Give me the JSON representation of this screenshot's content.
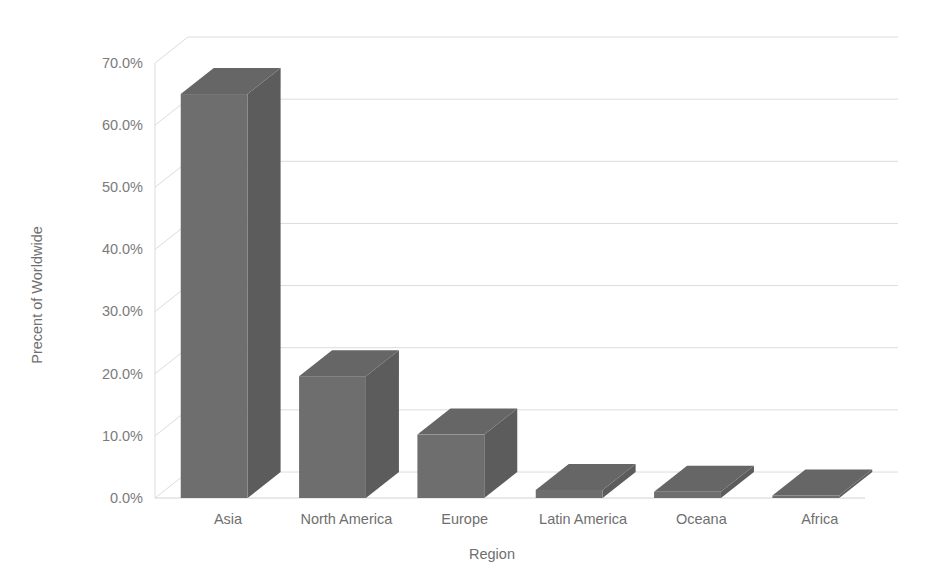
{
  "chart_data": {
    "type": "bar",
    "title": "",
    "subtitle": "",
    "xlabel": "Region",
    "ylabel": "Precent of Worldwide",
    "categories": [
      "Asia",
      "North America",
      "Europe",
      "Latin America",
      "Oceana",
      "Africa"
    ],
    "values": [
      65.0,
      19.6,
      10.2,
      1.3,
      1.0,
      0.4
    ],
    "series": [
      {
        "name": "Precent of Worldwide",
        "values": [
          65.0,
          19.6,
          10.2,
          1.3,
          1.0,
          0.4
        ]
      }
    ],
    "ylim": [
      0,
      70
    ],
    "ytick_values": [
      0,
      10,
      20,
      30,
      40,
      50,
      60,
      70
    ],
    "ytick_labels": [
      "0.0%",
      "10.0%",
      "20.0%",
      "30.0%",
      "40.0%",
      "50.0%",
      "60.0%",
      "70.0%"
    ],
    "grid": true,
    "grid_axis": "y",
    "legend": false,
    "legend_position": "none",
    "three_d": true,
    "annotations": [],
    "colors": {
      "bar_front": "#6e6e6e",
      "bar_side": "#5c5c5c",
      "bar_top": "#666666",
      "gridline": "#dcdcdc",
      "tick_text": "#7b7b7b",
      "axis_title_text": "#6f6f6f",
      "plot_background": "#ffffff"
    }
  },
  "axes": {
    "y_title": "Precent of Worldwide",
    "x_title": "Region",
    "y_ticks": [
      {
        "label": "70.0%",
        "value": 70
      },
      {
        "label": "60.0%",
        "value": 60
      },
      {
        "label": "50.0%",
        "value": 50
      },
      {
        "label": "40.0%",
        "value": 40
      },
      {
        "label": "30.0%",
        "value": 30
      },
      {
        "label": "20.0%",
        "value": 20
      },
      {
        "label": "10.0%",
        "value": 10
      },
      {
        "label": "0.0%",
        "value": 0
      }
    ],
    "x_categories": [
      {
        "label": "Asia",
        "value": 65.0
      },
      {
        "label": "North America",
        "value": 19.6
      },
      {
        "label": "Europe",
        "value": 10.2
      },
      {
        "label": "Latin America",
        "value": 1.3
      },
      {
        "label": "Oceana",
        "value": 1.0
      },
      {
        "label": "Africa",
        "value": 0.4
      }
    ]
  }
}
